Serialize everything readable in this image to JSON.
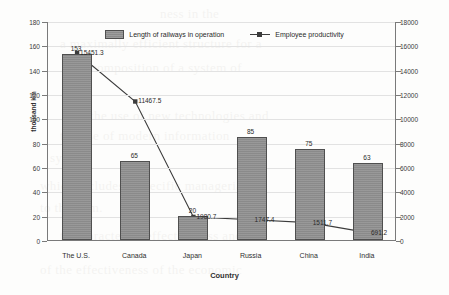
{
  "chart_data": {
    "type": "bar",
    "title": "",
    "xlabel": "Country",
    "ylabel": "thousand km",
    "y2label": "",
    "categories": [
      "The U.S.",
      "Canada",
      "Japan",
      "Russia",
      "China",
      "India"
    ],
    "ylim": [
      0,
      180
    ],
    "y2lim": [
      0,
      18000
    ],
    "yticks": [
      0,
      20,
      40,
      60,
      80,
      100,
      120,
      140,
      160,
      180
    ],
    "y2ticks": [
      0,
      2000,
      4000,
      6000,
      8000,
      10000,
      12000,
      14000,
      16000,
      18000
    ],
    "grid": true,
    "legend_position": "top-center",
    "series": [
      {
        "name": "Length of railways in operation",
        "type": "bar",
        "axis": "left",
        "color": "#8d8d8d",
        "values": [
          153,
          65,
          20,
          85,
          75,
          63
        ],
        "labels": [
          "153",
          "65",
          "20",
          "85",
          "75",
          "63"
        ]
      },
      {
        "name": "Employee productivity",
        "type": "line",
        "axis": "right",
        "color": "#3c3c3c",
        "values": [
          15451.3,
          11467.5,
          1980.7,
          1747.4,
          1511.7,
          691.2
        ],
        "labels": [
          "15451.3",
          "11467.5",
          "1980.7",
          "1747.4",
          "1511.7",
          "691.2"
        ]
      }
    ]
  },
  "legend": {
    "bar_label": "Length of railways in operation",
    "line_label": "Employee productivity"
  },
  "axes": {
    "left_title": "thousand km",
    "bottom_title": "Country"
  },
  "background_text": [
    "ness in the",
    "a maximally efficient structure for a",
    "the composition of a system of",
    "the use of new technologies and",
    "the use of modern information",
    "system.",
    "which includes a specific managerial",
    "to the firm.",
    "to characterize effectiveness and",
    "of the effectiveness of the economic"
  ]
}
